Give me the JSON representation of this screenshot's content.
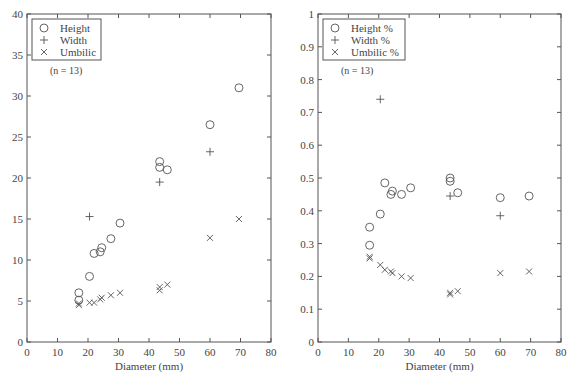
{
  "chart_data": [
    {
      "type": "scatter",
      "title": "",
      "xlabel": "Diameter (mm)",
      "ylabel": "",
      "xlim": [
        0,
        80
      ],
      "ylim": [
        0,
        40
      ],
      "xticks": [
        0,
        10,
        20,
        30,
        40,
        50,
        60,
        70,
        80
      ],
      "yticks": [
        0,
        5,
        10,
        15,
        20,
        25,
        30,
        35,
        40
      ],
      "grid": false,
      "legend_position": "top-left",
      "annotation": "(n = 13)",
      "series": [
        {
          "name": "Height",
          "marker": "circle",
          "x": [
            17,
            17,
            20.5,
            22,
            24,
            24.5,
            27.5,
            30.5,
            43.5,
            43.5,
            46,
            60,
            69.5
          ],
          "y": [
            6.0,
            5.1,
            8.0,
            10.8,
            11.0,
            11.5,
            12.6,
            14.5,
            22.0,
            21.3,
            21.0,
            26.5,
            31.0
          ]
        },
        {
          "name": "Width",
          "marker": "plus",
          "x": [
            20.5,
            43.5,
            60
          ],
          "y": [
            15.3,
            19.5,
            23.2
          ]
        },
        {
          "name": "Umbilic",
          "marker": "x",
          "x": [
            17,
            17,
            20.5,
            22,
            24,
            24.5,
            27.5,
            30.5,
            43.5,
            43.5,
            46,
            60,
            69.5
          ],
          "y": [
            4.5,
            4.7,
            4.8,
            4.8,
            5.2,
            5.4,
            5.7,
            6.0,
            6.3,
            6.7,
            7.0,
            12.7,
            15.0
          ]
        }
      ]
    },
    {
      "type": "scatter",
      "title": "",
      "xlabel": "Diameter (mm)",
      "ylabel": "",
      "xlim": [
        0,
        80
      ],
      "ylim": [
        0,
        1
      ],
      "xticks": [
        0,
        10,
        20,
        30,
        40,
        50,
        60,
        70,
        80
      ],
      "yticks": [
        0,
        0.1,
        0.2,
        0.3,
        0.4,
        0.5,
        0.6,
        0.7,
        0.8,
        0.9,
        1
      ],
      "grid": false,
      "legend_position": "top-left",
      "annotation": "(n = 13)",
      "series": [
        {
          "name": "Height %",
          "marker": "circle",
          "x": [
            17,
            17,
            20.5,
            22,
            24,
            24.5,
            27.5,
            30.5,
            43.5,
            43.5,
            46,
            60,
            69.5
          ],
          "y": [
            0.35,
            0.295,
            0.39,
            0.485,
            0.45,
            0.46,
            0.45,
            0.47,
            0.5,
            0.49,
            0.455,
            0.44,
            0.445
          ]
        },
        {
          "name": "Width %",
          "marker": "plus",
          "x": [
            20.5,
            43.5,
            60
          ],
          "y": [
            0.74,
            0.445,
            0.385
          ]
        },
        {
          "name": "Umbilic %",
          "marker": "x",
          "x": [
            17,
            17,
            20.5,
            22,
            24,
            24.5,
            27.5,
            30.5,
            43.5,
            43.5,
            46,
            60,
            69.5
          ],
          "y": [
            0.255,
            0.26,
            0.235,
            0.22,
            0.215,
            0.21,
            0.2,
            0.195,
            0.145,
            0.15,
            0.155,
            0.21,
            0.215
          ]
        }
      ]
    }
  ],
  "layout": {
    "panels": [
      {
        "left": 27,
        "right": 271,
        "top": 14,
        "bottom": 342
      },
      {
        "left": 318,
        "right": 561,
        "top": 14,
        "bottom": 342
      }
    ]
  }
}
